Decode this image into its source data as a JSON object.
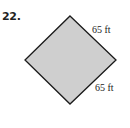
{
  "problem": {
    "number": "22."
  },
  "figure": {
    "shape": "square (rotated 45°, diamond)",
    "fill_color": "#cfcfcf",
    "stroke_color": "#1a1a1a",
    "vertices": {
      "top": [
        70,
        16
      ],
      "right": [
        116,
        60
      ],
      "bottom": [
        70,
        104
      ],
      "left": [
        25,
        60
      ]
    },
    "labels": {
      "top_right_side": "65 ft",
      "bottom_right_side": "65 ft"
    }
  }
}
